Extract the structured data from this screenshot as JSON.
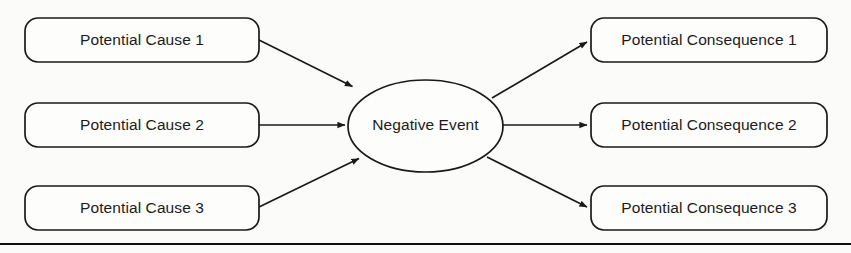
{
  "diagram": {
    "background_color": "#fbfbfa",
    "line_color": "#1a1a1a",
    "text_color": "#1b1b1b",
    "causes": [
      {
        "id": "cause-1",
        "label": "Potential Cause 1"
      },
      {
        "id": "cause-2",
        "label": "Potential Cause 2"
      },
      {
        "id": "cause-3",
        "label": "Potential Cause 3"
      }
    ],
    "center": {
      "id": "negative-event",
      "label": "Negative Event"
    },
    "consequences": [
      {
        "id": "consequence-1",
        "label": "Potential Consequence 1"
      },
      {
        "id": "consequence-2",
        "label": "Potential Consequence 2"
      },
      {
        "id": "consequence-3",
        "label": "Potential Consequence 3"
      }
    ],
    "connectors": [
      {
        "id": "arrow-cause-1-to-event",
        "from": "cause-1",
        "to": "negative-event",
        "direction": "right-down"
      },
      {
        "id": "arrow-cause-2-to-event",
        "from": "cause-2",
        "to": "negative-event",
        "direction": "right"
      },
      {
        "id": "arrow-cause-3-to-event",
        "from": "cause-3",
        "to": "negative-event",
        "direction": "right-up"
      },
      {
        "id": "arrow-event-to-consequence-1",
        "from": "negative-event",
        "to": "consequence-1",
        "direction": "right-up"
      },
      {
        "id": "arrow-event-to-consequence-2",
        "from": "negative-event",
        "to": "consequence-2",
        "direction": "right"
      },
      {
        "id": "arrow-event-to-consequence-3",
        "from": "negative-event",
        "to": "consequence-3",
        "direction": "right-down"
      }
    ],
    "footer_rule": {
      "id": "page-rule",
      "visible": true
    }
  }
}
